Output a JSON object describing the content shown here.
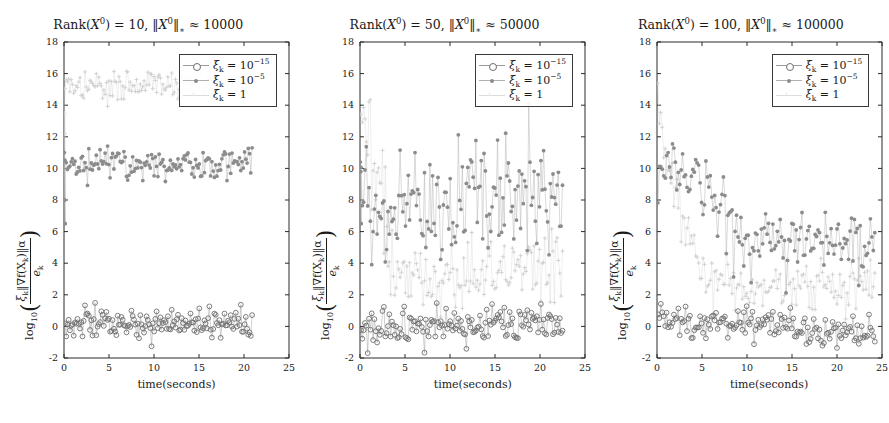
{
  "figure": {
    "width": 889,
    "height": 423,
    "background": "#ffffff"
  },
  "series_styles": {
    "xi_1e-15": {
      "color": "#6e6e6e",
      "marker": "open-circle",
      "line": "#9a9a9a"
    },
    "xi_1e-5": {
      "color": "#8c8c8c",
      "marker": "filled-circle",
      "line": "#b0b0b0"
    },
    "xi_1": {
      "color": "#cfcfcf",
      "marker": "plus",
      "line": "#dcdcdc"
    }
  },
  "axis": {
    "xlabel": "time(seconds)",
    "ylabel_prefix": "log",
    "ylabel_prefix_sub": "10",
    "ylabel_num_xi": "ξ",
    "ylabel_num_xi_sub": "k",
    "ylabel_num_grad": "‖∇f(X",
    "ylabel_num_grad_sub": "k",
    "ylabel_num_grad_end": ")‖α",
    "ylabel_den": "e",
    "ylabel_den_sub": "k",
    "xticks": [
      0,
      5,
      10,
      15,
      20,
      25
    ],
    "yticks": [
      -2,
      0,
      2,
      4,
      6,
      8,
      10,
      12,
      14,
      16,
      18
    ],
    "xlim": [
      0,
      25
    ],
    "ylim": [
      -2,
      18
    ],
    "grid": false
  },
  "legend": {
    "position": "upper-right",
    "entries": [
      {
        "name": "xi_1e-15",
        "label_xi": "ξ",
        "label_sub": "k",
        "label_eq": " = 10",
        "label_sup": "−15"
      },
      {
        "name": "xi_1e-5",
        "label_xi": "ξ",
        "label_sub": "k",
        "label_eq": " = 10",
        "label_sup": "−5"
      },
      {
        "name": "xi_1",
        "label_xi": "ξ",
        "label_sub": "k",
        "label_eq": " = 1",
        "label_sup": ""
      }
    ]
  },
  "panels": [
    {
      "id": "panel-rank-10",
      "title_rank": "Rank(X",
      "title_rank_sup": "0",
      "title_rank_eq": ") = 10, ‖X",
      "title_norm_sup": "0",
      "title_norm_tail": "‖",
      "title_norm_sub": "∗",
      "title_approx": " ≈ 10000",
      "rank": 10,
      "nuclear_norm": 10000
    },
    {
      "id": "panel-rank-50",
      "title_rank": "Rank(X",
      "title_rank_sup": "0",
      "title_rank_eq": ") = 50, ‖X",
      "title_norm_sup": "0",
      "title_norm_tail": "‖",
      "title_norm_sub": "∗",
      "title_approx": " ≈ 50000",
      "rank": 50,
      "nuclear_norm": 50000
    },
    {
      "id": "panel-rank-100",
      "title_rank": "Rank(X",
      "title_rank_sup": "0",
      "title_rank_eq": ") = 100, ‖X",
      "title_norm_sup": "0",
      "title_norm_tail": "‖",
      "title_norm_sub": "∗",
      "title_approx": " ≈ 100000",
      "rank": 100,
      "nuclear_norm": 100000
    }
  ],
  "chart_data": [
    {
      "type": "scatter",
      "title": "Rank(X^0) = 10, ||X^0||_* ≈ 10000",
      "xlabel": "time(seconds)",
      "ylabel": "log_10( xi_k ||grad f(X_k)|| alpha / e_k )",
      "xlim": [
        0,
        25
      ],
      "ylim": [
        -2,
        18
      ],
      "xticks": [
        0,
        5,
        10,
        15,
        20,
        25
      ],
      "yticks": [
        -2,
        0,
        2,
        4,
        6,
        8,
        10,
        12,
        14,
        16,
        18
      ],
      "grid": false,
      "legend_position": "upper-right",
      "series": [
        {
          "name": "xi_k = 10^-15",
          "marker": "open-circle",
          "color": "#6e6e6e",
          "n_points": 150,
          "x_start": 0.1,
          "x_end": 20.9,
          "mean_level": 0.2,
          "noise": 0.45,
          "profile": "flat",
          "seed": 11
        },
        {
          "name": "xi_k = 10^-5",
          "marker": "filled-circle",
          "color": "#8c8c8c",
          "n_points": 150,
          "x_start": 0.1,
          "x_end": 20.9,
          "mean_level": 10.3,
          "noise": 0.5,
          "profile": "flat",
          "seed": 12,
          "initial_spike": [
            11.0,
            8.0,
            6.5
          ]
        },
        {
          "name": "xi_k = 1",
          "marker": "plus",
          "color": "#cfcfcf",
          "n_points": 150,
          "x_start": 0.1,
          "x_end": 20.9,
          "mean_level": 15.3,
          "noise": 0.5,
          "profile": "flat",
          "seed": 13,
          "initial_spike": [
            13.5,
            12.2,
            8.0
          ]
        }
      ]
    },
    {
      "type": "scatter",
      "title": "Rank(X^0) = 50, ||X^0||_* ≈ 50000",
      "xlabel": "time(seconds)",
      "ylabel": "log_10( xi_k ||grad f(X_k)|| alpha / e_k )",
      "xlim": [
        0,
        25
      ],
      "ylim": [
        -2,
        18
      ],
      "xticks": [
        0,
        5,
        10,
        15,
        20,
        25
      ],
      "yticks": [
        -2,
        0,
        2,
        4,
        6,
        8,
        10,
        12,
        14,
        16,
        18
      ],
      "grid": false,
      "legend_position": "upper-right",
      "series": [
        {
          "name": "xi_k = 10^-15",
          "marker": "open-circle",
          "color": "#6e6e6e",
          "n_points": 150,
          "x_start": 0.1,
          "x_end": 22.5,
          "mean_level": 0.1,
          "noise": 0.55,
          "profile": "flat",
          "seed": 21
        },
        {
          "name": "xi_k = 10^-5",
          "marker": "filled-circle",
          "color": "#8c8c8c",
          "n_points": 150,
          "x_start": 0.1,
          "x_end": 22.5,
          "mean_level": 8.0,
          "noise": 1.7,
          "profile": "rising",
          "level_start": 7.0,
          "level_end": 9.0,
          "seed": 22,
          "initial_spike": [
            10.4,
            9.8,
            6.5
          ]
        },
        {
          "name": "xi_k = 1",
          "marker": "plus",
          "color": "#cfcfcf",
          "n_points": 150,
          "x_start": 0.1,
          "x_end": 22.5,
          "mean_level": 3.6,
          "noise": 1.3,
          "profile": "decay-then-rise",
          "level_start": 15.0,
          "level_end": 4.2,
          "decay_end_x": 3.0,
          "seed": 23
        }
      ]
    },
    {
      "type": "scatter",
      "title": "Rank(X^0) = 100, ||X^0||_* ≈ 100000",
      "xlabel": "time(seconds)",
      "ylabel": "log_10( xi_k ||grad f(X_k)|| alpha / e_k )",
      "xlim": [
        0,
        25
      ],
      "ylim": [
        -2,
        18
      ],
      "xticks": [
        0,
        5,
        10,
        15,
        20,
        25
      ],
      "yticks": [
        -2,
        0,
        2,
        4,
        6,
        8,
        10,
        12,
        14,
        16,
        18
      ],
      "grid": false,
      "legend_position": "upper-right",
      "series": [
        {
          "name": "xi_k = 10^-15",
          "marker": "open-circle",
          "color": "#6e6e6e",
          "n_points": 150,
          "x_start": 0.1,
          "x_end": 24.2,
          "mean_level": -0.1,
          "noise": 0.5,
          "profile": "slow-decay",
          "level_start": 0.5,
          "level_end": -0.6,
          "seed": 31
        },
        {
          "name": "xi_k = 10^-5",
          "marker": "filled-circle",
          "color": "#8c8c8c",
          "n_points": 150,
          "x_start": 0.1,
          "x_end": 24.2,
          "mean_level": 6.5,
          "noise": 1.0,
          "profile": "plateau-then-drop",
          "level_start": 10.2,
          "level_end": 5.5,
          "plateau_end_x": 4.5,
          "drop_end_x": 9.0,
          "seed": 32
        },
        {
          "name": "xi_k = 1",
          "marker": "plus",
          "color": "#cfcfcf",
          "n_points": 150,
          "x_start": 0.1,
          "x_end": 24.2,
          "mean_level": 2.6,
          "noise": 0.9,
          "profile": "decay-then-flat",
          "level_start": 15.5,
          "level_end": 2.5,
          "decay_end_x": 6.0,
          "seed": 33
        }
      ]
    }
  ]
}
